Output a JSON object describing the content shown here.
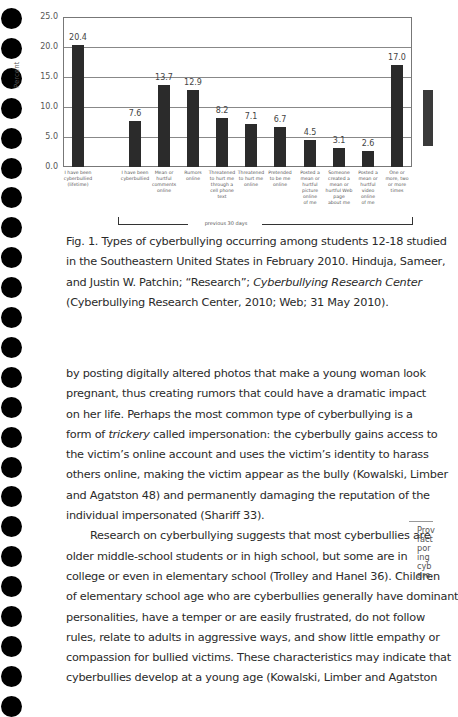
{
  "chart_data": {
    "type": "bar",
    "title": "",
    "xlabel": "",
    "ylabel": "Percent",
    "ylim": [
      0,
      25
    ],
    "yticks": [
      "0.0",
      "5.0",
      "10.0",
      "15.0",
      "20.0",
      "25.0"
    ],
    "grid": true,
    "categories": [
      "I have been cyberbullied (lifetime)",
      "I have been cyberbullied",
      "Mean or hurtful comments online",
      "Rumors online",
      "Threatened to hurt me through a cell phone text",
      "Threatened to hurt me online",
      "Pretended to be me online",
      "Posted a mean or hurtful picture online of me",
      "Someone created a mean or hurtful Web page about me",
      "Posted a mean or hurtful video online of me",
      "One or more, two or more times"
    ],
    "values": [
      20.4,
      7.6,
      13.7,
      12.9,
      8.2,
      7.1,
      6.7,
      4.5,
      3.1,
      2.6,
      17.0
    ],
    "value_labels": [
      "20.4",
      "7.6",
      "13.7",
      "12.9",
      "8.2",
      "7.1",
      "6.7",
      "4.5",
      "3.1",
      "2.6",
      "17.0"
    ],
    "category_labels_display": [
      "I have been\ncyberbullied\n(lifetime)",
      "I have been\ncyberbullied",
      "Mean or\nhurtful\ncomments\nonline",
      "Rumors\nonline",
      "Threatened\nto hurt me\nthrough a\ncell phone\ntext",
      "Threatened\nto hurt me\nonline",
      "Pretended\nto be me\nonline",
      "Posted a\nmean or\nhurtful\npicture\nonline\nof me",
      "Someone\ncreated a\nmean or\nhurtful Web\npage\nabout me",
      "Posted a\nmean or\nhurtful\nvideo\nonline\nof me",
      "One or\nmore, two\nor more\ntimes"
    ],
    "bracket_annotation": "previous 30 days",
    "bar_color": "#2b2b2b"
  },
  "caption": {
    "lines": [
      "Fig. 1. Types of cyberbullying occurring among students 12-18 studied",
      "in the Southeastern United States in February 2010. Hinduja, Sameer,",
      "and Justin W. Patchin; “Research”; ",
      "Cyberbullying Research Center",
      "(Cyberbullying Research Center, 2010; Web; 31 May 2010)."
    ]
  },
  "body": {
    "p1_lines": [
      "by posting digitally altered photos that make a young woman look",
      "pregnant, thus creating rumors that could have a dramatic impact",
      "on her life. Perhaps the most common type of cyberbullying is a",
      "form of ",
      "trickery",
      " called impersonation: the cyberbully gains access to",
      "the victim’s online account and uses the victim’s identity to harass",
      "others online, making the victim appear as the bully (Kowalski, Limber",
      "and Agatston 48) and permanently damaging the reputation of the",
      "individual impersonated (Shariff 33)."
    ],
    "p2_lines": [
      "Research on cyberbullying suggests that most cyberbullies are",
      "older middle-school students or in high school, but some are in",
      "college or even in elementary school (Trolley and Hanel 36). Children",
      "of elementary school age who are cyberbullies generally have dominant",
      "personalities, have a temper or are easily frustrated, do not follow",
      "rules, relate to adults in aggressive ways, and show little empathy or",
      "compassion for bullied victims. These characteristics may indicate that",
      "cyberbullies develop at a young age (Kowalski, Limber and Agatston"
    ]
  },
  "margin_note": {
    "text": "Prov\nfact\npor\ning\ncyb\nare."
  }
}
